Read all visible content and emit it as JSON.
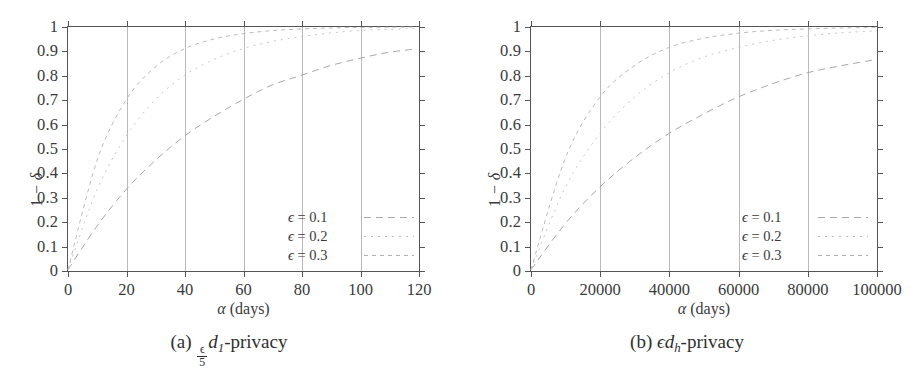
{
  "figure": {
    "panels": [
      {
        "id": "panel-a",
        "caption_prefix": "(a)",
        "caption_numerator": "ϵ",
        "caption_denominator": "5",
        "caption_symbol": "d",
        "caption_subscript": "1",
        "caption_suffix": "-privacy",
        "axis_x_title_symbol": "α",
        "axis_x_title_unit": "(days)",
        "axis_y_title": "1 − δ",
        "x_ticks": [
          "0",
          "20",
          "40",
          "60",
          "80",
          "100",
          "120"
        ],
        "y_ticks": [
          "0",
          "0.1",
          "0.2",
          "0.3",
          "0.4",
          "0.5",
          "0.6",
          "0.7",
          "0.8",
          "0.9",
          "1"
        ],
        "legend": [
          {
            "label_prefix": "ϵ",
            "label_eq": " = ",
            "label_value": "0.1",
            "style": "s-dash1"
          },
          {
            "label_prefix": "ϵ",
            "label_eq": " = ",
            "label_value": "0.2",
            "style": "s-dash2"
          },
          {
            "label_prefix": "ϵ",
            "label_eq": " = ",
            "label_value": "0.3",
            "style": "s-dash3"
          }
        ]
      },
      {
        "id": "panel-b",
        "caption_prefix": "(b)",
        "caption_numerator": "",
        "caption_denominator": "",
        "caption_symbol": "ϵd",
        "caption_subscript": "h",
        "caption_suffix": "-privacy",
        "axis_x_title_symbol": "α",
        "axis_x_title_unit": "(days)",
        "axis_y_title": "1 − δ",
        "x_ticks": [
          "0",
          "20000",
          "40000",
          "60000",
          "80000",
          "100000"
        ],
        "y_ticks": [
          "0",
          "0.1",
          "0.2",
          "0.3",
          "0.4",
          "0.5",
          "0.6",
          "0.7",
          "0.8",
          "0.9",
          "1"
        ],
        "legend": [
          {
            "label_prefix": "ϵ",
            "label_eq": " = ",
            "label_value": "0.1",
            "style": "s-dash1"
          },
          {
            "label_prefix": "ϵ",
            "label_eq": " = ",
            "label_value": "0.2",
            "style": "s-dash2"
          },
          {
            "label_prefix": "ϵ",
            "label_eq": " = ",
            "label_value": "0.3",
            "style": "s-dash3"
          }
        ]
      }
    ]
  },
  "chart_data": [
    {
      "type": "line",
      "title": "(a) ϵ/5 d₁-privacy",
      "xlabel": "α (days)",
      "ylabel": "1 − δ",
      "xlim": [
        0,
        120
      ],
      "ylim": [
        0,
        1
      ],
      "xticks": [
        0,
        20,
        40,
        60,
        80,
        100,
        120
      ],
      "yticks": [
        0,
        0.1,
        0.2,
        0.3,
        0.4,
        0.5,
        0.6,
        0.7,
        0.8,
        0.9,
        1
      ],
      "grid": "vertical",
      "legend_position": "lower-right-inside",
      "x": [
        0,
        10,
        20,
        30,
        40,
        50,
        60,
        70,
        80,
        90,
        100,
        110,
        120
      ],
      "series": [
        {
          "name": "ϵ = 0.1",
          "values": [
            0.0,
            0.18,
            0.33,
            0.45,
            0.55,
            0.63,
            0.7,
            0.76,
            0.8,
            0.84,
            0.87,
            0.895,
            0.91
          ]
        },
        {
          "name": "ϵ = 0.2",
          "values": [
            0.0,
            0.33,
            0.55,
            0.7,
            0.8,
            0.865,
            0.91,
            0.94,
            0.96,
            0.975,
            0.985,
            0.99,
            0.995
          ]
        },
        {
          "name": "ϵ = 0.3",
          "values": [
            0.0,
            0.45,
            0.7,
            0.835,
            0.91,
            0.95,
            0.972,
            0.985,
            0.992,
            0.996,
            0.998,
            0.999,
            1.0
          ]
        }
      ]
    },
    {
      "type": "line",
      "title": "(b) ϵdₕ-privacy",
      "xlabel": "α (days)",
      "ylabel": "1 − δ",
      "xlim": [
        0,
        100000
      ],
      "ylim": [
        0,
        1
      ],
      "xticks": [
        0,
        20000,
        40000,
        60000,
        80000,
        100000
      ],
      "yticks": [
        0,
        0.1,
        0.2,
        0.3,
        0.4,
        0.5,
        0.6,
        0.7,
        0.8,
        0.9,
        1
      ],
      "grid": "vertical",
      "legend_position": "lower-right-inside",
      "x": [
        0,
        10000,
        20000,
        30000,
        40000,
        50000,
        60000,
        70000,
        80000,
        90000,
        100000
      ],
      "series": [
        {
          "name": "ϵ = 0.1",
          "values": [
            0.0,
            0.19,
            0.34,
            0.46,
            0.56,
            0.64,
            0.71,
            0.765,
            0.81,
            0.84,
            0.865
          ]
        },
        {
          "name": "ϵ = 0.2",
          "values": [
            0.0,
            0.34,
            0.56,
            0.71,
            0.81,
            0.875,
            0.915,
            0.944,
            0.963,
            0.976,
            0.984
          ]
        },
        {
          "name": "ϵ = 0.3",
          "values": [
            0.0,
            0.46,
            0.71,
            0.84,
            0.915,
            0.953,
            0.974,
            0.986,
            0.992,
            0.996,
            0.998
          ]
        }
      ]
    }
  ]
}
